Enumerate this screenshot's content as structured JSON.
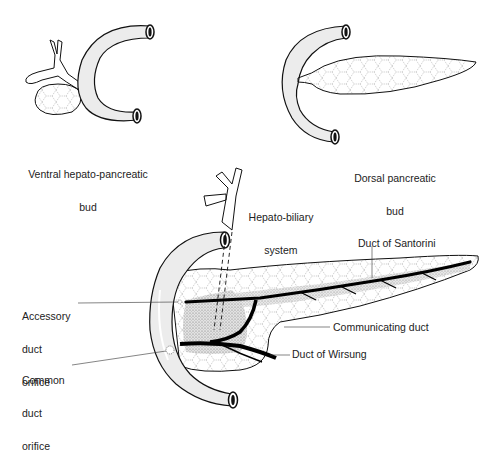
{
  "figure": {
    "colors": {
      "outline": "#111111",
      "duodenum_fill": "#ececec",
      "pancreas_fill": "#f7f7f7",
      "stipple_fill": "#cfcfcf",
      "duct": "#000000",
      "background": "#ffffff"
    }
  },
  "panels": {
    "ventral": {
      "label_line1": "Ventral hepato-pancreatic",
      "label_line2": "bud"
    },
    "dorsal": {
      "label_line1": "Dorsal pancreatic",
      "label_line2": "bud"
    },
    "mature": {
      "hepato_biliary_line1": "Hepato-biliary",
      "hepato_biliary_line2": "system",
      "santorini": "Duct of Santorini",
      "accessory_line1": "Accessory",
      "accessory_line2": "duct",
      "accessory_line3": "orifice",
      "common_line1": "Common",
      "common_line2": "duct",
      "common_line3": "orifice",
      "communicating": "Communicating duct",
      "wirsung": "Duct of Wirsung"
    }
  }
}
